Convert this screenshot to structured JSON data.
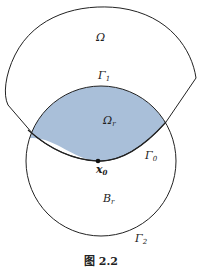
{
  "figure": {
    "caption": "图 2.2",
    "colors": {
      "fill": "#a9bfd9",
      "stroke": "#222222",
      "background": "#ffffff"
    },
    "labels": {
      "omega": {
        "base": "Ω",
        "sub": ""
      },
      "gamma1": {
        "base": "Γ",
        "sub": "1"
      },
      "omega_r": {
        "base": "Ω",
        "sub": "r"
      },
      "gamma0": {
        "base": "Γ",
        "sub": "0"
      },
      "x0": {
        "base": "x",
        "sub": "0"
      },
      "b_r": {
        "base": "B",
        "sub": "r"
      },
      "gamma2": {
        "base": "Γ",
        "sub": "2"
      }
    },
    "point_x0": {
      "cx": 98,
      "cy": 161
    }
  }
}
